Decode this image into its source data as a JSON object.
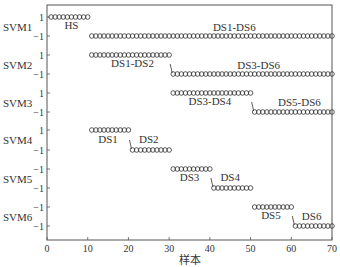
{
  "chart_data": {
    "type": "scatter",
    "title": "",
    "xlabel": "样本",
    "ylabel": "",
    "xlim": [
      0,
      70
    ],
    "x_ticks": [
      "0",
      "10",
      "20",
      "30",
      "40",
      "50",
      "60",
      "70"
    ],
    "grid": false,
    "rows": [
      {
        "name": "SVM1",
        "tick_labels": [
          "1",
          "−1"
        ]
      },
      {
        "name": "SVM2",
        "tick_labels": [
          "1",
          "−1"
        ]
      },
      {
        "name": "SVM3",
        "tick_labels": [
          "1",
          "−1"
        ]
      },
      {
        "name": "SVM4",
        "tick_labels": [
          "1",
          "−1"
        ]
      },
      {
        "name": "SVM5",
        "tick_labels": [
          "−1",
          "−1"
        ]
      },
      {
        "name": "SVM6",
        "tick_labels": [
          "−1",
          "−1"
        ]
      }
    ],
    "series": [
      {
        "svm": "SVM1",
        "label": "HS",
        "value": 1,
        "x_start": 1,
        "x_end": 10
      },
      {
        "svm": "SVM1",
        "label": "DS1-DS6",
        "value": -1,
        "x_start": 11,
        "x_end": 70
      },
      {
        "svm": "SVM2",
        "label": "DS1-DS2",
        "value": 1,
        "x_start": 11,
        "x_end": 30
      },
      {
        "svm": "SVM2",
        "label": "DS3-DS6",
        "value": -1,
        "x_start": 31,
        "x_end": 70
      },
      {
        "svm": "SVM3",
        "label": "DS3-DS4",
        "value": 1,
        "x_start": 31,
        "x_end": 50
      },
      {
        "svm": "SVM3",
        "label": "DS5-DS6",
        "value": -1,
        "x_start": 51,
        "x_end": 70
      },
      {
        "svm": "SVM4",
        "label": "DS1",
        "value": 1,
        "x_start": 11,
        "x_end": 20
      },
      {
        "svm": "SVM4",
        "label": "DS2",
        "value": -1,
        "x_start": 21,
        "x_end": 30
      },
      {
        "svm": "SVM5",
        "label": "DS3",
        "value": 1,
        "x_start": 31,
        "x_end": 40
      },
      {
        "svm": "SVM5",
        "label": "DS4",
        "value": -1,
        "x_start": 41,
        "x_end": 50
      },
      {
        "svm": "SVM6",
        "label": "DS5",
        "value": 1,
        "x_start": 51,
        "x_end": 60
      },
      {
        "svm": "SVM6",
        "label": "DS6",
        "value": -1,
        "x_start": 61,
        "x_end": 70
      }
    ],
    "marker": "open-circle"
  }
}
